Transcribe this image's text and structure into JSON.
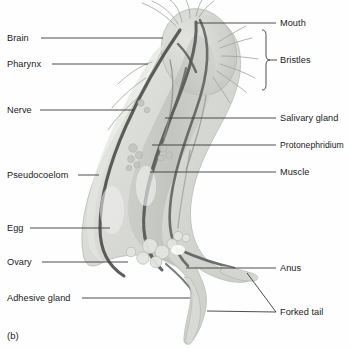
{
  "figure": {
    "caption": "(b)",
    "background_color": "#fefefe",
    "leader_line_color": "#3a3a3a",
    "text_color": "#1a1a1a",
    "body_fill": "#d7d9d4",
    "body_fill_light": "#e6e7e3",
    "organ_dark": "#4a4a4a",
    "organ_mid": "#9a9e98"
  },
  "labels_left": [
    {
      "id": "brain",
      "text": "Brain",
      "x": 7,
      "y": 34,
      "line_x1": 41,
      "line_x2": 163,
      "line_y": 38
    },
    {
      "id": "pharynx",
      "text": "Pharynx",
      "x": 7,
      "y": 60,
      "line_x1": 52,
      "line_x2": 148,
      "line_y": 64
    },
    {
      "id": "nerve",
      "text": "Nerve",
      "x": 7,
      "y": 106,
      "line_x1": 40,
      "line_x2": 134,
      "line_y": 110
    },
    {
      "id": "pseudocoelom",
      "text": "Pseudocoelom",
      "x": 7,
      "y": 171,
      "line_x1": 78,
      "line_x2": 99,
      "line_y": 175
    },
    {
      "id": "egg",
      "text": "Egg",
      "x": 7,
      "y": 224,
      "line_x1": 30,
      "line_x2": 110,
      "line_y": 228
    },
    {
      "id": "ovary",
      "text": "Ovary",
      "x": 7,
      "y": 258,
      "line_x1": 42,
      "line_x2": 128,
      "line_y": 262
    },
    {
      "id": "adhesive-gland",
      "text": "Adhesive gland",
      "x": 7,
      "y": 294,
      "line_x1": 82,
      "line_x2": 190,
      "line_y": 298
    }
  ],
  "labels_right": [
    {
      "id": "mouth",
      "text": "Mouth",
      "x": 280,
      "y": 19,
      "line_x1": 197,
      "line_x2": 276,
      "line_y": 23
    },
    {
      "id": "bristles",
      "text": "Bristles",
      "x": 280,
      "y": 56,
      "brace": true
    },
    {
      "id": "salivary-gland",
      "text": "Salivary gland",
      "x": 280,
      "y": 114,
      "line_x1": 165,
      "line_x2": 276,
      "line_y": 118
    },
    {
      "id": "protonephridium",
      "text": "Protonephridium",
      "x": 280,
      "y": 141,
      "line_x1": 152,
      "line_x2": 276,
      "line_y": 145
    },
    {
      "id": "muscle",
      "text": "Muscle",
      "x": 280,
      "y": 168,
      "line_x1": 150,
      "line_x2": 276,
      "line_y": 172
    },
    {
      "id": "anus",
      "text": "Anus",
      "x": 280,
      "y": 264,
      "line_x1": 186,
      "line_x2": 276,
      "line_y": 268
    },
    {
      "id": "forked-tail",
      "text": "Forked tail",
      "x": 280,
      "y": 308,
      "line_x1": 206,
      "line_x2": 276,
      "line_y": 312
    }
  ],
  "bristles_brace": {
    "x": 266,
    "top_y": 30,
    "bottom_y": 90,
    "tick_y": 60,
    "tick_x2": 277
  },
  "forked_tail_leaders": [
    {
      "from_x": 276,
      "from_y": 312,
      "to_x": 247,
      "to_y": 273
    },
    {
      "from_x": 276,
      "from_y": 312,
      "to_x": 207,
      "to_y": 311
    }
  ]
}
